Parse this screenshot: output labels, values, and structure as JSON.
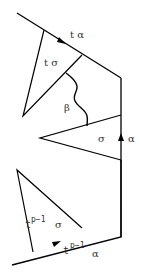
{
  "diagram": {
    "labels": {
      "top_edge": "t α",
      "upper_triangle": "t σ",
      "wavy_path": "β",
      "middle_triangle": "σ",
      "right_edge": "α",
      "lower_triangle_base": "t",
      "lower_triangle_exp": "p−1",
      "lower_triangle_sym": "σ",
      "bottom_edge_base": "t",
      "bottom_edge_exp": "p−1",
      "bottom_edge_sym": "α"
    },
    "stroke_color": "#000000",
    "text_color": "#333333"
  }
}
